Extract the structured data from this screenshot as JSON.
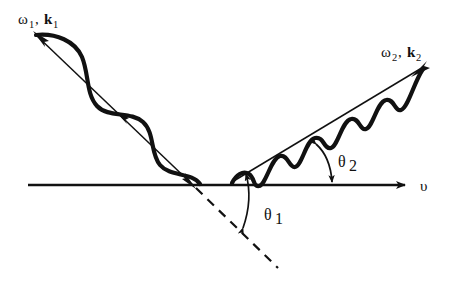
{
  "figure": {
    "background_color": "#ffffff",
    "stroke_color": "#111111",
    "width": 464,
    "height": 282
  },
  "labels": {
    "incident_omega": "ω",
    "incident_omega_sub": "1",
    "incident_comma": ",",
    "incident_k": "k",
    "incident_k_sub": "1",
    "scattered_omega": "ω",
    "scattered_omega_sub": "2",
    "scattered_comma": ",",
    "scattered_k": "k",
    "scattered_k_sub": "2",
    "axis_symbol": "υ",
    "theta1": "θ",
    "theta1_sub": "1",
    "theta2": "θ",
    "theta2_sub": "2"
  },
  "geometry": {
    "axis_line": {
      "x1": 28,
      "y1": 185,
      "x2": 412,
      "y2": 185
    },
    "vertex": {
      "x": 193,
      "y": 185
    },
    "incident_ray": {
      "x1": 33,
      "y1": 32,
      "x2": 195,
      "y2": 187
    },
    "scattered_ray": {
      "x1": 233,
      "y1": 181,
      "x2": 424,
      "y2": 66
    },
    "dashed_extension": {
      "x1": 196,
      "y1": 188,
      "x2": 278,
      "y2": 268
    },
    "incident_wavelength_px": 72,
    "scattered_wavelength_px": 36,
    "incident_amplitude_px": 15,
    "scattered_amplitude_px": 9,
    "theta1_degrees": 44,
    "theta2_degrees": 31
  },
  "arrows": {
    "incident_head_top_left": true,
    "incident_head_mid": true,
    "incident_head_vertex": true,
    "scattered_head_tip": true,
    "axis_head_right": true,
    "theta1_arc_double_headed": true,
    "theta2_arc_double_headed": true
  }
}
